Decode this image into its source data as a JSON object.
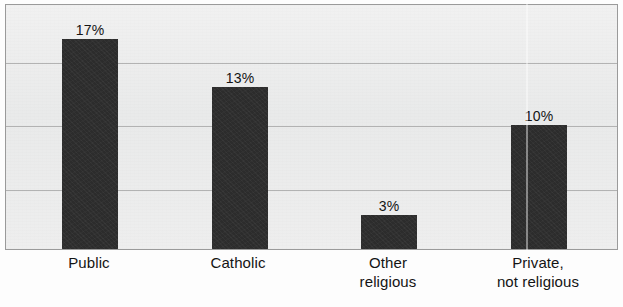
{
  "chart_data": {
    "type": "bar",
    "title": "",
    "subtitle": "",
    "xlabel": "",
    "ylabel": "",
    "categories": [
      "Public",
      "Catholic",
      "Other religious",
      "Private, not religious"
    ],
    "category_lines": [
      [
        "Public"
      ],
      [
        "Catholic"
      ],
      [
        "Other",
        "religious"
      ],
      [
        "Private,",
        "not religious"
      ]
    ],
    "values": [
      17,
      13,
      3,
      10
    ],
    "value_labels": [
      "17%",
      "13%",
      "3%",
      "10%"
    ],
    "unit": "%",
    "ylim": [
      0,
      20
    ],
    "ytick_values": [
      0,
      5,
      10,
      15,
      20
    ],
    "ytick_labels": [],
    "grid": "horizontal",
    "gridlines_at": [
      5,
      10,
      15
    ],
    "legend": "none",
    "series": [
      {
        "name": "",
        "values": [
          17,
          13,
          3,
          10
        ]
      }
    ]
  },
  "style": {
    "bar_color": "#2c2c2c",
    "plot_background": "#eceded",
    "gridline_color": "#a8a8a8",
    "border_color": "#9a9a9a",
    "text_color": "#141414",
    "page_background": "#fdfdfd"
  },
  "artifacts": {
    "scan_fold_line": "vertical-light-streak"
  }
}
